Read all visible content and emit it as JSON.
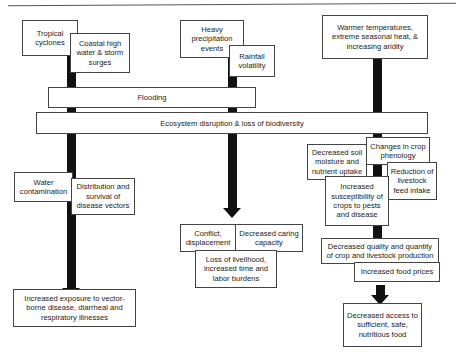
{
  "drivers": {
    "tropical_cyclones": "Tropical cyclones",
    "coastal_high_water": "Coastal high water & storm surges",
    "heavy_precipitation": "Heavy precipitation events",
    "rainfall_volatility": "Rainfall volatility",
    "warmer_temperatures": "Warmer temperatures, extreme seasonal heat, & increasing aridity"
  },
  "bands": {
    "flooding": "Flooding",
    "ecosystem": "Ecosystem disruption & loss of biodiversity"
  },
  "health_pathway": {
    "water_contamination": "Water contamination",
    "disease_vectors": "Distribution and survival of disease vectors",
    "outcome": "Increased exposure to vector-borne disease, diarrheal and respiratory illnesses"
  },
  "social_pathway": {
    "conflict": "Conflict, displacement",
    "caring_capacity": "Decreased caring capacity",
    "livelihood": "Loss of livelihood, increased time and labor burdens"
  },
  "food_pathway": {
    "soil_moisture": "Decreased soil moisture and nutrient uptake",
    "crop_phenology": "Changes in crop phenology",
    "livestock_feed": "Reduction of livestock feed intake",
    "pest_susceptibility": "Increased susceptibility of crops to pests and disease",
    "production_quality": "Decreased quality and quantity of crop and livestock production",
    "food_prices": "Increased food prices",
    "outcome": "Decreased access to sufficient, safe, nutritious food"
  }
}
